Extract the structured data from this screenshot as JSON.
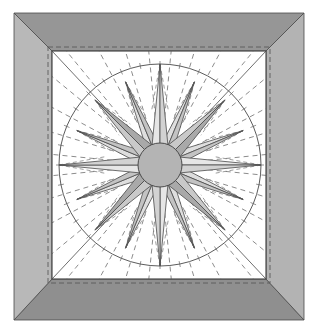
{
  "diagram": {
    "outer": {
      "x1": 14,
      "y1": 13,
      "x2": 304,
      "y2": 320
    },
    "inner": {
      "x1": 52,
      "y1": 51,
      "x2": 266,
      "y2": 279
    },
    "seam_inset": 4,
    "center": {
      "x": 160,
      "y": 165
    },
    "circle_radius": 101,
    "hub_radius": 22,
    "points": {
      "cardinal": {
        "count": 4,
        "length": 101,
        "half_width_deg": 9.5,
        "start_angle": -90
      },
      "diagonal": {
        "count": 4,
        "length": 92,
        "half_width_deg": 10,
        "start_angle": -45
      },
      "minor": {
        "count": 8,
        "length": 90,
        "half_width_deg": 7.5,
        "start_angle": -67.5
      }
    },
    "colors": {
      "border_top": "#969696",
      "border_bottom": "#8f8f8f",
      "border_left": "#b8b8b8",
      "border_right": "#b3b3b3",
      "background": "#ffffff",
      "panel": "#ffffff",
      "line": "#4a4a4a",
      "dash": "#5a5a5a",
      "hub": "#b4b4b4",
      "cardinal_light": "#e6e6e6",
      "cardinal_dark": "#d2d2d2",
      "diagonal_light": "#c9c9c9",
      "diagonal_dark": "#a9a9a9",
      "minor_light": "#dedede",
      "minor_dark": "#c3c3c3"
    }
  }
}
